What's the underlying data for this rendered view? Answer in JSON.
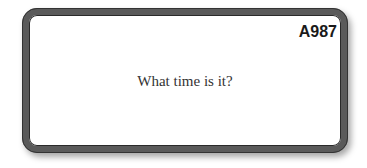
{
  "card": {
    "code": "A987",
    "question": "What time is it?"
  },
  "colors": {
    "frame": "#5a5a5a",
    "background": "#ffffff",
    "text": "#333333"
  }
}
